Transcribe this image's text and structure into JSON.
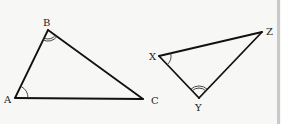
{
  "diagram": {
    "type": "similar-triangles",
    "triangles": [
      {
        "name": "ABC",
        "vertices": [
          {
            "label": "A",
            "x": 15,
            "y": 98,
            "label_x": 4,
            "label_y": 103,
            "angle_marks": 1
          },
          {
            "label": "B",
            "x": 48,
            "y": 30,
            "label_x": 43,
            "label_y": 26,
            "angle_marks": 2
          },
          {
            "label": "C",
            "x": 143,
            "y": 99,
            "label_x": 151,
            "label_y": 104,
            "angle_marks": 0
          }
        ]
      },
      {
        "name": "XYZ",
        "vertices": [
          {
            "label": "X",
            "x": 159,
            "y": 56,
            "label_x": 149,
            "label_y": 60,
            "angle_marks": 1
          },
          {
            "label": "Y",
            "x": 199,
            "y": 98,
            "label_x": 195,
            "label_y": 111,
            "angle_marks": 2
          },
          {
            "label": "Z",
            "x": 262,
            "y": 32,
            "label_x": 266,
            "label_y": 35,
            "angle_marks": 0
          }
        ]
      }
    ],
    "colors": {
      "background": "#f7f7f6",
      "line": "#111111",
      "border": "#c9c9c9"
    }
  },
  "labels": {
    "A": "A",
    "B": "B",
    "C": "C",
    "X": "X",
    "Y": "Y",
    "Z": "Z"
  }
}
